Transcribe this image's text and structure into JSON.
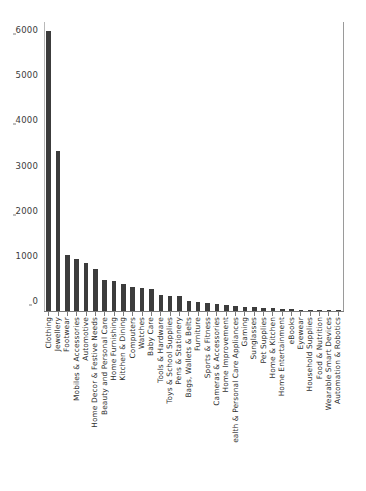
{
  "chart_data": {
    "type": "bar",
    "title": "",
    "xlabel": "",
    "ylabel": "",
    "ylim": [
      0,
      6400
    ],
    "grid": false,
    "legend": null,
    "yticks": [
      0,
      1000,
      2000,
      3000,
      4000,
      5000,
      6000
    ],
    "ytick_labels": [
      "0",
      "1000",
      "2000",
      "3000",
      "4000",
      "5000",
      "6000"
    ],
    "bar_color": "#3c3c3c",
    "categories": [
      "Clothing",
      "Jewellery",
      "Footwear",
      "Mobiles & Accessories",
      "Automotive",
      "Home Decor & Festive Needs",
      "Beauty and Personal Care",
      "Home Furnishing",
      "Kitchen & Dining",
      "Computers",
      "Watches",
      "Baby Care",
      "Tools & Hardware",
      "Toys & School Supplies",
      "Pens & Stationery",
      "Bags, Wallets & Belts",
      "Furniture",
      "Sports & Fitness",
      "Cameras & Accessories",
      "Home Improvement",
      "ealth & Personal Care Appliances",
      "Gaming",
      "Sunglasses",
      "Pet Supplies",
      "Home & Kitchen",
      "Home Entertainment",
      "eBooks",
      "Eyewear",
      "Household Supplies",
      "Food & Nutrition",
      "Wearable Smart Devices",
      "Automation & Robotics"
    ],
    "values": [
      6200,
      3550,
      1240,
      1150,
      1060,
      920,
      680,
      660,
      600,
      540,
      500,
      480,
      360,
      340,
      340,
      230,
      190,
      170,
      150,
      130,
      110,
      95,
      80,
      70,
      60,
      50,
      40,
      30,
      25,
      20,
      14,
      8
    ]
  }
}
